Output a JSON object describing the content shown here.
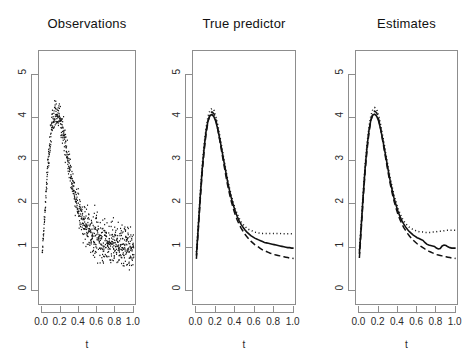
{
  "figure": {
    "background": "#ffffff",
    "axis_color": "#8d8d8d",
    "ink_color": "#111111",
    "panel_count": 3
  },
  "panels": [
    {
      "id": "observations",
      "title": "Observations",
      "xlabel": "t",
      "ylabel": "",
      "box": {
        "left": 38,
        "top": 50,
        "width": 98,
        "height": 255
      }
    },
    {
      "id": "true-predictor",
      "title": "True  predictor",
      "xlabel": "t",
      "ylabel": "",
      "box": {
        "left": 192,
        "top": 50,
        "width": 104,
        "height": 255
      }
    },
    {
      "id": "estimates",
      "title": "Estimates",
      "xlabel": "t",
      "ylabel": "",
      "box": {
        "left": 355,
        "top": 50,
        "width": 103,
        "height": 255
      }
    }
  ],
  "axes": {
    "y_ticks": [
      "0",
      "1",
      "2",
      "3",
      "4",
      "5"
    ],
    "y_tick_values": [
      0,
      1,
      2,
      3,
      4,
      5
    ],
    "ylim": [
      -0.35,
      5.55
    ],
    "x_ticks": [
      "0.0",
      "0.2",
      "0.4",
      "0.6",
      "0.8",
      "1.0"
    ],
    "x_tick_values": [
      0.0,
      0.2,
      0.4,
      0.6,
      0.8,
      1.0
    ],
    "xlim": [
      -0.035,
      1.035
    ],
    "grid": false
  },
  "chart_data": {
    "type": "line",
    "xlabel": "t",
    "ylabel": "",
    "xlim": [
      -0.035,
      1.035
    ],
    "ylim": [
      -0.35,
      5.55
    ],
    "grid": false,
    "legend_position": "none",
    "x": [
      0.0,
      0.02,
      0.04,
      0.06,
      0.08,
      0.1,
      0.12,
      0.14,
      0.16,
      0.18,
      0.2,
      0.22,
      0.24,
      0.26,
      0.28,
      0.3,
      0.32,
      0.34,
      0.36,
      0.38,
      0.4,
      0.42,
      0.44,
      0.46,
      0.48,
      0.5,
      0.52,
      0.54,
      0.56,
      0.58,
      0.6,
      0.62,
      0.64,
      0.66,
      0.68,
      0.7,
      0.72,
      0.74,
      0.76,
      0.78,
      0.8,
      0.82,
      0.84,
      0.86,
      0.88,
      0.9,
      0.92,
      0.94,
      0.96,
      0.98,
      1.0
    ],
    "panels": [
      {
        "name": "Observations",
        "type": "scatter",
        "description": "dense noisy observations scattered about the mean curve; heteroscedastic, noise grows with t",
        "mean": [
          0.85,
          1.55,
          2.25,
          2.85,
          3.35,
          3.72,
          3.96,
          4.08,
          4.1,
          4.05,
          3.94,
          3.76,
          3.54,
          3.3,
          3.05,
          2.8,
          2.56,
          2.35,
          2.16,
          2.0,
          1.86,
          1.74,
          1.64,
          1.56,
          1.49,
          1.43,
          1.38,
          1.34,
          1.3,
          1.27,
          1.24,
          1.22,
          1.2,
          1.18,
          1.16,
          1.14,
          1.13,
          1.12,
          1.11,
          1.1,
          1.09,
          1.08,
          1.07,
          1.06,
          1.05,
          1.04,
          1.03,
          1.02,
          1.01,
          1.0,
          1.0
        ],
        "noise_sd": [
          0.1,
          0.14,
          0.18,
          0.22,
          0.24,
          0.26,
          0.27,
          0.28,
          0.28,
          0.28,
          0.28,
          0.27,
          0.27,
          0.26,
          0.26,
          0.26,
          0.26,
          0.27,
          0.28,
          0.29,
          0.3,
          0.32,
          0.34,
          0.36,
          0.38,
          0.4,
          0.41,
          0.42,
          0.42,
          0.42,
          0.42,
          0.42,
          0.42,
          0.42,
          0.42,
          0.42,
          0.42,
          0.42,
          0.42,
          0.42,
          0.42,
          0.42,
          0.42,
          0.42,
          0.42,
          0.42,
          0.42,
          0.42,
          0.42,
          0.42,
          0.42
        ],
        "n_points": 800
      },
      {
        "name": "True predictor",
        "type": "line",
        "series": [
          {
            "name": "true mean",
            "style": "solid",
            "values": [
              0.82,
              1.5,
              2.2,
              2.82,
              3.32,
              3.7,
              3.94,
              4.06,
              4.08,
              4.03,
              3.92,
              3.74,
              3.52,
              3.28,
              3.03,
              2.78,
              2.54,
              2.33,
              2.14,
              1.98,
              1.84,
              1.72,
              1.62,
              1.54,
              1.47,
              1.41,
              1.36,
              1.32,
              1.28,
              1.25,
              1.22,
              1.2,
              1.18,
              1.16,
              1.14,
              1.12,
              1.11,
              1.1,
              1.09,
              1.08,
              1.07,
              1.06,
              1.05,
              1.04,
              1.03,
              1.02,
              1.01,
              1.0,
              1.0,
              0.99,
              0.99
            ]
          },
          {
            "name": "upper band",
            "style": "dotted",
            "values": [
              0.9,
              1.58,
              2.28,
              2.9,
              3.4,
              3.78,
              4.04,
              4.18,
              4.22,
              4.18,
              4.04,
              3.84,
              3.6,
              3.35,
              3.09,
              2.84,
              2.6,
              2.39,
              2.2,
              2.04,
              1.9,
              1.78,
              1.68,
              1.6,
              1.54,
              1.49,
              1.45,
              1.42,
              1.4,
              1.38,
              1.36,
              1.35,
              1.34,
              1.34,
              1.33,
              1.33,
              1.33,
              1.33,
              1.33,
              1.33,
              1.33,
              1.33,
              1.33,
              1.33,
              1.32,
              1.32,
              1.32,
              1.32,
              1.32,
              1.32,
              1.32
            ]
          },
          {
            "name": "lower band",
            "style": "dashed",
            "values": [
              0.74,
              1.42,
              2.12,
              2.74,
              3.24,
              3.64,
              3.92,
              4.08,
              4.14,
              4.1,
              3.96,
              3.74,
              3.48,
              3.22,
              2.96,
              2.7,
              2.46,
              2.25,
              2.06,
              1.9,
              1.76,
              1.64,
              1.54,
              1.45,
              1.38,
              1.31,
              1.25,
              1.2,
              1.15,
              1.11,
              1.07,
              1.04,
              1.01,
              0.98,
              0.95,
              0.93,
              0.91,
              0.89,
              0.87,
              0.86,
              0.84,
              0.83,
              0.82,
              0.81,
              0.8,
              0.79,
              0.78,
              0.77,
              0.76,
              0.76,
              0.75
            ]
          }
        ]
      },
      {
        "name": "Estimates",
        "type": "line",
        "series": [
          {
            "name": "estimated mean",
            "style": "solid",
            "values": [
              0.86,
              1.52,
              2.22,
              2.84,
              3.34,
              3.72,
              3.96,
              4.07,
              4.09,
              4.04,
              3.93,
              3.75,
              3.53,
              3.29,
              3.04,
              2.79,
              2.55,
              2.34,
              2.15,
              1.99,
              1.85,
              1.73,
              1.63,
              1.55,
              1.48,
              1.42,
              1.37,
              1.33,
              1.29,
              1.26,
              1.23,
              1.21,
              1.19,
              1.17,
              1.12,
              1.08,
              1.06,
              1.05,
              1.04,
              1.03,
              0.99,
              0.97,
              0.98,
              1.04,
              1.06,
              1.05,
              1.02,
              1.0,
              0.99,
              0.99,
              0.99
            ]
          },
          {
            "name": "upper band",
            "style": "dotted",
            "values": [
              0.94,
              1.6,
              2.3,
              2.92,
              3.42,
              3.8,
              4.06,
              4.2,
              4.24,
              4.2,
              4.06,
              3.86,
              3.62,
              3.37,
              3.11,
              2.86,
              2.62,
              2.41,
              2.22,
              2.06,
              1.92,
              1.8,
              1.7,
              1.62,
              1.56,
              1.51,
              1.47,
              1.44,
              1.42,
              1.4,
              1.38,
              1.37,
              1.36,
              1.36,
              1.35,
              1.35,
              1.35,
              1.35,
              1.36,
              1.36,
              1.37,
              1.38,
              1.38,
              1.39,
              1.39,
              1.4,
              1.4,
              1.4,
              1.4,
              1.4,
              1.4
            ]
          },
          {
            "name": "lower band",
            "style": "dashed",
            "values": [
              0.76,
              1.44,
              2.14,
              2.76,
              3.26,
              3.66,
              3.94,
              4.1,
              4.16,
              4.12,
              3.98,
              3.76,
              3.5,
              3.24,
              2.98,
              2.72,
              2.48,
              2.27,
              2.08,
              1.92,
              1.78,
              1.66,
              1.56,
              1.47,
              1.4,
              1.33,
              1.27,
              1.22,
              1.17,
              1.13,
              1.09,
              1.06,
              1.03,
              1.0,
              0.97,
              0.95,
              0.92,
              0.9,
              0.88,
              0.86,
              0.84,
              0.83,
              0.82,
              0.81,
              0.8,
              0.79,
              0.78,
              0.77,
              0.76,
              0.76,
              0.75
            ]
          }
        ]
      }
    ]
  }
}
